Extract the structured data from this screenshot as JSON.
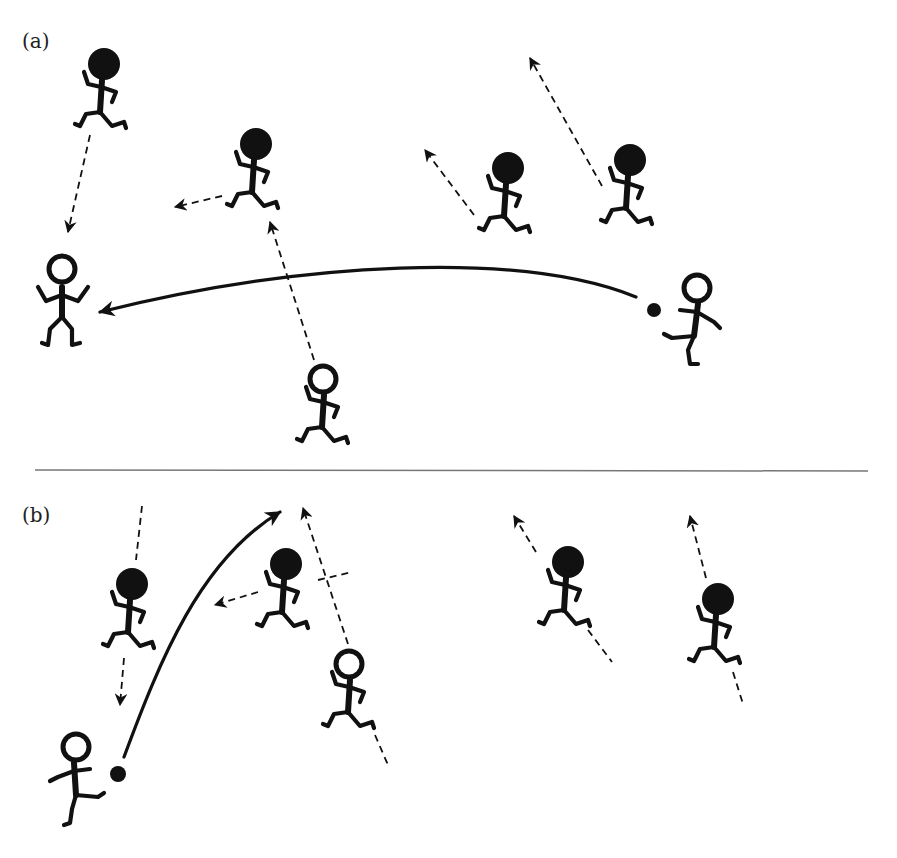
{
  "figure": {
    "panels": [
      {
        "label": "(a)",
        "description": "Long pass across the field to an unmarked teammate",
        "attackers": 3,
        "defenders": 5,
        "ball_holder": "right attacker",
        "pass": "long curved pass to the left"
      },
      {
        "label": "(b)",
        "description": "Lofted pass into space ahead of a running teammate",
        "attackers": 2,
        "defenders": 4,
        "ball_holder": "bottom-left attacker",
        "pass": "curved pass up toward the top of the panel"
      }
    ],
    "legend_semantics": {
      "open_head_figure": "attacker (team in possession)",
      "filled_head_figure": "defender",
      "solid_arrow": "pass of the ball",
      "dashed_arrow": "player run"
    },
    "colors": {
      "ink": "#111111",
      "background": "#ffffff",
      "divider": "#777777"
    }
  }
}
